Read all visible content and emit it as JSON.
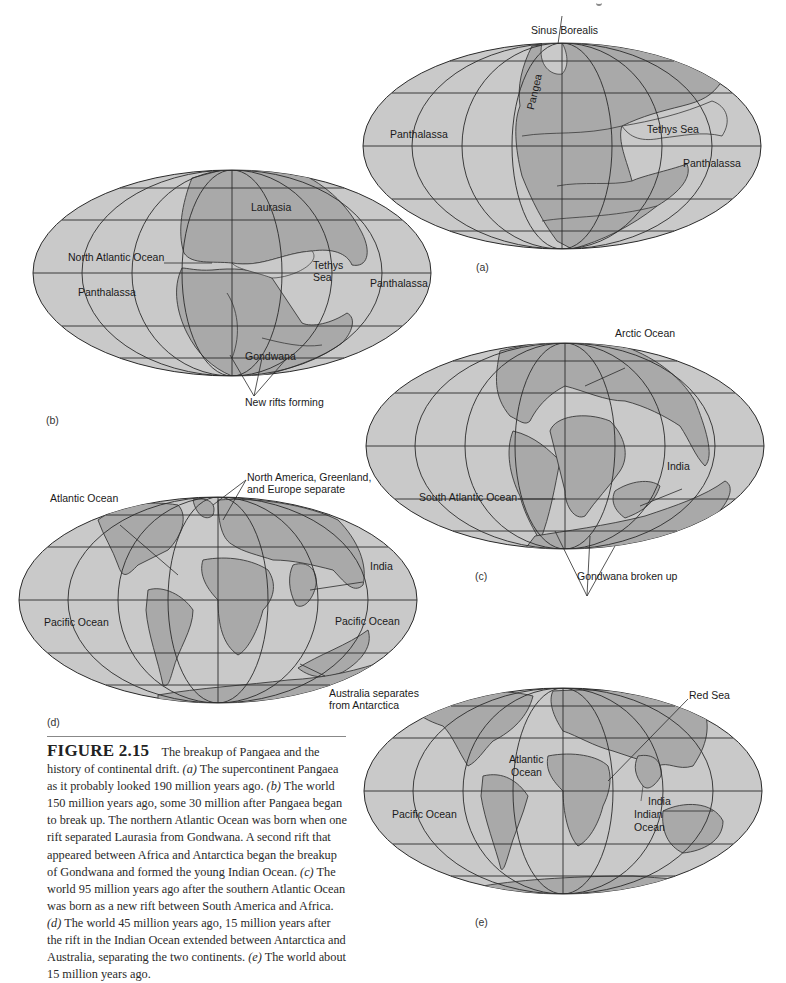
{
  "figure": {
    "number": "FIGURE 2.15",
    "caption_parts": {
      "intro": "The breakup of Pangaea and the history of continental drift.",
      "a_tag": "(a)",
      "a_text": "The supercontinent Pangaea as it probably looked 190 million years ago.",
      "b_tag": "(b)",
      "b_text": "The world 150 million years ago, some 30 million after Pangaea began to break up. The northern Atlantic Ocean was born when one rift separated Laurasia from Gondwana. A second rift that appeared between Africa and Antarctica began the breakup of Gondwana and formed the young Indian Ocean.",
      "c_tag": "(c)",
      "c_text": "The world 95 million years ago after the southern Atlantic Ocean was born as a new rift between South America and Africa.",
      "d_tag": "(d)",
      "d_text": "The world 45 million years ago, 15 million years after the rift in the Indian Ocean extended between Antarctica and Australia, separating the two continents.",
      "e_tag": "(e)",
      "e_text": "The world about 15 million years ago."
    }
  },
  "colors": {
    "ocean": "#c9c9c9",
    "land": "#a9a9a9",
    "grid": "#2b2b2b",
    "coast": "#3a3a3a"
  },
  "panels": {
    "a": {
      "letter": "(a)",
      "era": "190 million years ago",
      "labels": {
        "sinus_borealis": "Sinus Borealis",
        "pangea": "Pangea",
        "panthalassa_west": "Panthalassa",
        "tethys_sea": "Tethys Sea",
        "panthalassa_east": "Panthalassa"
      }
    },
    "b": {
      "letter": "(b)",
      "era": "150 million years ago",
      "labels": {
        "laurasia": "Laurasia",
        "north_atlantic": "North Atlantic Ocean",
        "panthalassa_west": "Panthalassa",
        "tethys_sea_1": "Tethys",
        "tethys_sea_2": "Sea",
        "panthalassa_east": "Panthalassa",
        "gondwana": "Gondwana",
        "new_rifts": "New rifts forming"
      }
    },
    "c": {
      "letter": "(c)",
      "era": "95 million years ago",
      "labels": {
        "arctic_ocean": "Arctic Ocean",
        "india": "India",
        "south_atlantic": "South Atlantic Ocean",
        "gondwana_broken": "Gondwana broken up"
      }
    },
    "d": {
      "letter": "(d)",
      "era": "45 million years ago",
      "labels": {
        "atlantic_ocean": "Atlantic Ocean",
        "na_greenland_1": "North America, Greenland,",
        "na_greenland_2": "and Europe separate",
        "india": "India",
        "pacific_west": "Pacific Ocean",
        "pacific_east": "Pacific Ocean",
        "australia_1": "Australia separates",
        "australia_2": "from Antarctica"
      }
    },
    "e": {
      "letter": "(e)",
      "era": "15 million years ago",
      "labels": {
        "red_sea": "Red Sea",
        "atlantic_1": "Atlantic",
        "atlantic_2": "Ocean",
        "pacific": "Pacific Ocean",
        "india": "India",
        "indian_1": "Indian",
        "indian_2": "Ocean"
      }
    }
  }
}
